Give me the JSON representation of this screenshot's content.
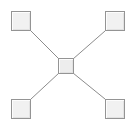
{
  "diagram": {
    "type": "star-topology",
    "background_color": "#ffffff",
    "width": 131,
    "height": 125,
    "node_style": {
      "fill_color": "#f1f1f1",
      "border_color": "#949494",
      "highlight_color": "#fdfdfd",
      "shadow_color": "#e2e2e2",
      "shape": "square"
    },
    "edge_style": {
      "color": "#8c8c8c",
      "width": 1,
      "style": "solid"
    },
    "nodes": [
      {
        "id": "node-top-left",
        "name": "top-left-node",
        "label": "",
        "x": 11,
        "y": 11,
        "size": 20,
        "role": "leaf"
      },
      {
        "id": "node-top-right",
        "name": "top-right-node",
        "label": "",
        "x": 105,
        "y": 11,
        "size": 20,
        "role": "leaf"
      },
      {
        "id": "node-center",
        "name": "center-hub-node",
        "label": "",
        "x": 58,
        "y": 58,
        "size": 16,
        "role": "hub"
      },
      {
        "id": "node-bottom-left",
        "name": "bottom-left-node",
        "label": "",
        "x": 11,
        "y": 99,
        "size": 20,
        "role": "leaf"
      },
      {
        "id": "node-bottom-right",
        "name": "bottom-right-node",
        "label": "",
        "x": 105,
        "y": 99,
        "size": 20,
        "role": "leaf"
      }
    ],
    "edges": [
      {
        "id": "edge-top-left",
        "name": "edge-top-left-to-center",
        "from": "node-top-left",
        "to": "node-center",
        "x1": 31,
        "y1": 31,
        "x2": 59,
        "y2": 59
      },
      {
        "id": "edge-top-right",
        "name": "edge-top-right-to-center",
        "from": "node-top-right",
        "to": "node-center",
        "x1": 105,
        "y1": 31,
        "x2": 73,
        "y2": 59
      },
      {
        "id": "edge-bottom-left",
        "name": "edge-bottom-left-to-center",
        "from": "node-bottom-left",
        "to": "node-center",
        "x1": 31,
        "y1": 99,
        "x2": 59,
        "y2": 73
      },
      {
        "id": "edge-bottom-right",
        "name": "edge-bottom-right-to-center",
        "from": "node-bottom-right",
        "to": "node-center",
        "x1": 105,
        "y1": 99,
        "x2": 73,
        "y2": 73
      }
    ]
  }
}
